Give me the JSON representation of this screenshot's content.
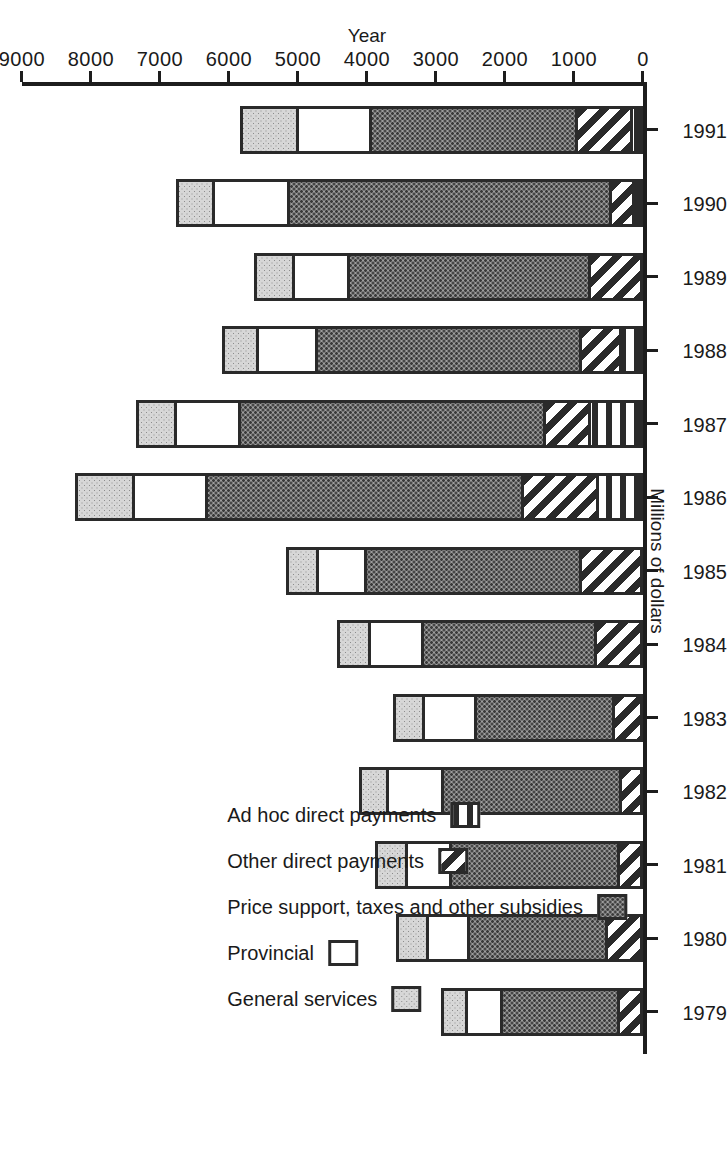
{
  "chart_data": {
    "type": "bar",
    "orientation": "horizontal-stacked",
    "title": "",
    "xlabel": "Millions of dollars",
    "ylabel": "Year",
    "categories": [
      "1979",
      "1980",
      "1981",
      "1982",
      "1983",
      "1984",
      "1985",
      "1986",
      "1987",
      "1988",
      "1989",
      "1990",
      "1991"
    ],
    "tick_labels": [
      "0",
      "1000",
      "2000",
      "3000",
      "4000",
      "5000",
      "6000",
      "7000",
      "8000",
      "9000"
    ],
    "ticks": [
      0,
      1000,
      2000,
      3000,
      4000,
      5000,
      6000,
      7000,
      8000,
      9000
    ],
    "xlim": [
      0,
      9000
    ],
    "grid": false,
    "legend_position": "inside-left",
    "series": [
      {
        "name": "Ad hoc direct payments",
        "pattern": "vertical-stripes",
        "values": [
          0,
          0,
          0,
          0,
          0,
          0,
          0,
          640,
          760,
          300,
          0,
          120,
          150
        ]
      },
      {
        "name": "Other direct payments",
        "pattern": "diagonal-stripes",
        "values": [
          330,
          500,
          330,
          300,
          400,
          670,
          880,
          1090,
          640,
          580,
          760,
          330,
          790
        ]
      },
      {
        "name": "Price support, taxes and other subsidies",
        "pattern": "dark-dots",
        "values": [
          1700,
          2000,
          2440,
          2580,
          2000,
          2510,
          3120,
          4570,
          4430,
          3830,
          3490,
          4670,
          2990
        ]
      },
      {
        "name": "Provincial",
        "pattern": "white",
        "values": [
          500,
          600,
          640,
          800,
          760,
          760,
          700,
          1060,
          930,
          850,
          790,
          1080,
          1060
        ]
      },
      {
        "name": "General services",
        "pattern": "light-dots",
        "values": [
          350,
          440,
          430,
          390,
          420,
          450,
          430,
          830,
          550,
          500,
          560,
          520,
          810
        ]
      }
    ],
    "stack_order_from_zero": [
      "Ad hoc direct payments",
      "Other direct payments",
      "Price support, taxes and other subsidies",
      "Provincial",
      "General services"
    ],
    "totals": [
      2880,
      3540,
      3840,
      4070,
      3580,
      4390,
      5130,
      8190,
      7310,
      6060,
      5600,
      6720,
      5800
    ],
    "legend": [
      {
        "label": "General services",
        "pattern": "light-dots"
      },
      {
        "label": "Provincial",
        "pattern": "white"
      },
      {
        "label": "Price support, taxes and other subsidies",
        "pattern": "dark-dots"
      },
      {
        "label": "Other direct payments",
        "pattern": "diagonal-stripes"
      },
      {
        "label": "Ad hoc direct payments",
        "pattern": "vertical-stripes"
      }
    ]
  },
  "colors": {
    "ink": "#1d1d1d",
    "light_fill": "#d7d7d7",
    "dark_fill": "#9e9e9e",
    "white_fill": "#ffffff"
  }
}
